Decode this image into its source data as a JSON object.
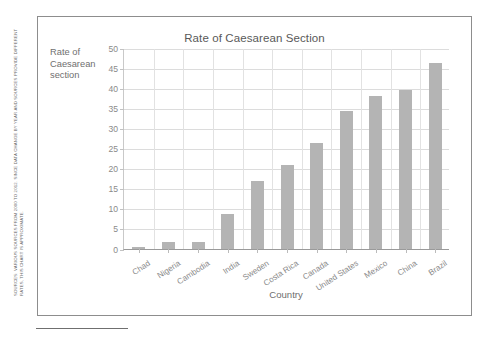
{
  "source_note": "SOURCES: VARIOUS SOURCES FROM 2000 TO 2012. SINCE DATA CHANGE BY YEAR AND SOURCES PROVIDE DIFFERENT RATES, THIS CHART IS APPROXIMATE.",
  "axis_title_y_line1": "Rate of",
  "axis_title_y_line2": "Caesarean",
  "axis_title_y_line3": "section",
  "colors": {
    "bar_fill": "#b4b4b4",
    "gridline": "#dcdcdc",
    "frame": "#8d8d8d",
    "text": "#6f6f6f",
    "tick_text": "#8a8a8a"
  },
  "chart_data": {
    "type": "bar",
    "title": "Rate of Caesarean Section",
    "xlabel": "Country",
    "ylabel": "Rate of Caesarean section",
    "categories": [
      "Chad",
      "Nigeria",
      "Cambodia",
      "India",
      "Sweden",
      "Costa Rica",
      "Canada",
      "United States",
      "Mexico",
      "China",
      "Brazil"
    ],
    "values": [
      0.4,
      1.8,
      1.8,
      8.7,
      16.9,
      20.8,
      26.4,
      34.3,
      38.0,
      39.5,
      46.2
    ],
    "ylim": [
      0,
      50
    ],
    "yticks": [
      0,
      5,
      10,
      15,
      20,
      25,
      30,
      35,
      40,
      45,
      50
    ],
    "ytick_labels": [
      "0",
      "5",
      "10",
      "15",
      "20",
      "25",
      "30",
      "35",
      "40",
      "45",
      "50"
    ],
    "grid": true,
    "legend": false
  }
}
